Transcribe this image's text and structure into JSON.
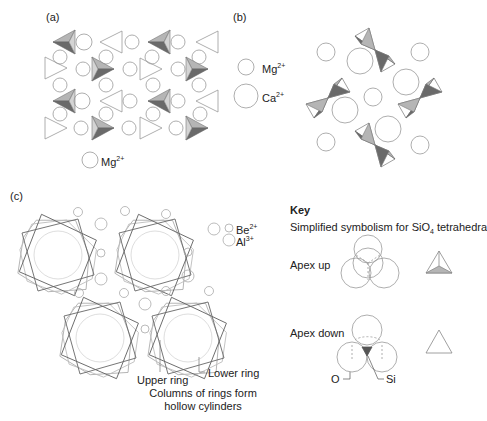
{
  "panels": {
    "a": {
      "label": "(a)",
      "legend": [
        {
          "ion": "Mg",
          "charge": "2+"
        }
      ]
    },
    "b": {
      "label": "(b)",
      "legend": [
        {
          "ion": "Mg",
          "charge": "2+"
        },
        {
          "ion": "Ca",
          "charge": "2+"
        }
      ]
    },
    "c": {
      "label": "(c)",
      "legend": [
        {
          "ion": "Be",
          "charge": "2+"
        },
        {
          "ion": "Al",
          "charge": "3+"
        }
      ],
      "annotations": {
        "upper_ring": "Upper ring",
        "lower_ring": "Lower ring",
        "caption_line1": "Columns of rings form",
        "caption_line2": "hollow cylinders"
      }
    }
  },
  "key": {
    "title": "Key",
    "subtitle_pre": "Simplified symbolism for SiO",
    "subtitle_sub": "4",
    "subtitle_post": " tetrahedra",
    "apex_up": "Apex up",
    "apex_down": "Apex down",
    "o_label": "O",
    "si_label": "Si"
  },
  "colors": {
    "stroke": "#8a8a8a",
    "dark_face": "#6e6e6e",
    "light_face": "#b8b8b8",
    "ring_dark": "#666666",
    "ring_light": "#aaaaaa"
  }
}
